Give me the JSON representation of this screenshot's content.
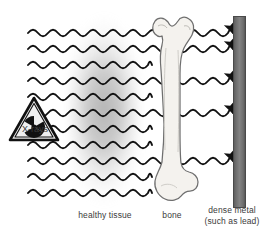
{
  "figure": {
    "width": 268,
    "height": 232,
    "background": "#ffffff"
  },
  "source": {
    "icon": "radiation-hazard-triangle-icon",
    "label": "X-rays",
    "symbol": "radiation-trefoil",
    "triangle_fill": "#e8e8e8",
    "triangle_stroke": "#111111",
    "trefoil_color": "#111111"
  },
  "labels": {
    "healthy_tissue": "healthy tissue",
    "bone": "bone",
    "dense_metal_line1": "dense metal",
    "dense_metal_line2": "(such as lead)"
  },
  "materials": {
    "tissue": {
      "name": "healthy tissue",
      "color": "#8c8c8c",
      "opacity": 0.5,
      "x": 68,
      "y": 14,
      "width": 72,
      "height": 192
    },
    "bone": {
      "name": "bone",
      "fill": "#f2f0eb",
      "stroke": "#6b6b6b",
      "x": 150,
      "y": 16,
      "width": 48,
      "height": 190
    },
    "dense_metal": {
      "name": "dense metal (such as lead)",
      "fill": "#7d7d7d",
      "stroke": "#4a4a4a",
      "x": 233,
      "y": 16,
      "width": 13,
      "height": 192
    }
  },
  "waves": {
    "count": 11,
    "color": "#111111",
    "stroke_width": 1.9,
    "start_x": 28,
    "wall_x": 233,
    "wavelength": 20,
    "amplitude": 3.2,
    "rows": [
      {
        "y": 33,
        "penetrates": true,
        "arrow": true,
        "blocked_at": 233
      },
      {
        "y": 49,
        "penetrates": true,
        "arrow": true,
        "blocked_at": 233
      },
      {
        "y": 65,
        "penetrates": false,
        "arrow": false,
        "blocked_at": 152
      },
      {
        "y": 81,
        "penetrates": true,
        "arrow": true,
        "blocked_at": 233
      },
      {
        "y": 97,
        "penetrates": false,
        "arrow": false,
        "blocked_at": 152
      },
      {
        "y": 113,
        "penetrates": true,
        "arrow": true,
        "blocked_at": 233
      },
      {
        "y": 129,
        "penetrates": false,
        "arrow": false,
        "blocked_at": 152
      },
      {
        "y": 145,
        "penetrates": false,
        "arrow": false,
        "blocked_at": 152
      },
      {
        "y": 161,
        "penetrates": true,
        "arrow": true,
        "blocked_at": 233
      },
      {
        "y": 177,
        "penetrates": false,
        "arrow": false,
        "blocked_at": 152
      },
      {
        "y": 193,
        "penetrates": false,
        "arrow": false,
        "blocked_at": 152
      }
    ],
    "arrow_count": 5
  }
}
